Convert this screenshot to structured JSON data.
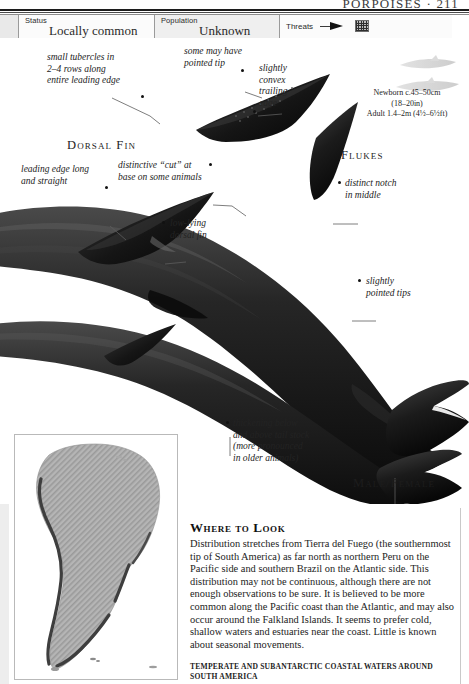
{
  "running_head": "PORPOISES · 211",
  "status_bar": {
    "status": {
      "key": "Status",
      "value": "Locally common"
    },
    "population": {
      "key": "Population",
      "value": "Unknown"
    },
    "threats": {
      "key": "Threats",
      "icons": [
        "harpoon-icon",
        "net-icon"
      ]
    }
  },
  "annotations": {
    "tubercles": "small tubercles in\n2–4 rows along\nentire leading edge",
    "pointed_tip": "some may have\npointed tip",
    "convex_trailing": "slightly\nconvex\ntrailing\nedge",
    "leading_edge": "leading edge long\nand straight",
    "distinctive_cut": "distinctive “cut” at\nbase on some animals",
    "low_lying": "low-lying\ndorsal fin",
    "distinct_notch": "distinct notch\nin middle",
    "pointed_tips": "slightly\npointed tips",
    "thickening": "thickening below\nand above tail stock\n(more pronounced\nin older animals)"
  },
  "section_labels": {
    "dorsal_fin": "Dorsal Fin",
    "flukes": "Flukes",
    "male_female": "Male/Female"
  },
  "size_box": {
    "newborn": "Newborn c.45–50cm",
    "newborn_imperial": "(18–20in)",
    "adult": "Adult 1.4–2m (4½–6½ft)"
  },
  "where_to_look": {
    "heading": "Where to Look",
    "body": "Distribution stretches from Tierra del Fuego (the southernmost tip of South America) as far north as northern Peru on the Pacific side and southern Brazil on the Atlantic side. This distribution may not be continuous, although there are not enough observations to be sure. It is believed to be more common along the Pacific coast than the Atlantic, and may also occur around the Falkland Islands. It seems to prefer cold, shallow waters and estuaries near the coast. Little is known about seasonal movements.",
    "caption": "Temperate and subantarctic coastal waters around South America"
  },
  "map": {
    "name": "south-america-distribution-map",
    "landmass_color": "#a9a9a9",
    "range_color": "#4a4a4a",
    "background_color": "#ffffff"
  },
  "colors": {
    "body_dark": "#171717",
    "body_mid": "#2f2f2f",
    "body_light": "#585858",
    "rule": "#1c1c1c"
  }
}
